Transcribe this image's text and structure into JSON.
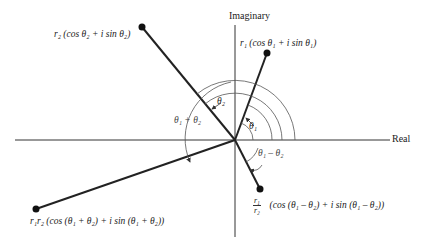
{
  "diagram": {
    "axes": {
      "vertical_label": "Imaginary",
      "horizontal_label": "Real"
    },
    "points": {
      "z1": "r₁ (cos θ₁ + i sin θ₁)",
      "z2": "r₂ (cos θ₂ + i sin θ₂)",
      "product": "r₁r₂  (cos (θ₁ + θ₂)  +  i sin (θ₁ + θ₂))",
      "quotient_frac_top": "r₁",
      "quotient_frac_bottom": "r₂",
      "quotient": "(cos (θ₁ – θ₂) +  i sin (θ₁ – θ₂))"
    },
    "angles": {
      "theta1": "θ₁",
      "theta2": "θ₂",
      "sum": "θ₁ + θ₂",
      "difference": "θ₁ – θ₂"
    },
    "colors": {
      "line": "#222222",
      "arc": "#555555",
      "text": "#222222"
    }
  }
}
